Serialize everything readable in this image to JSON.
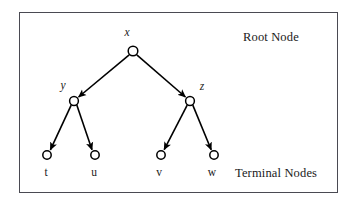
{
  "figure": {
    "type": "diagram",
    "diagram_kind": "binary-tree",
    "background_color": "#ffffff",
    "stroke_color": "#000000",
    "frame_color": "#4a4a52",
    "annotations": {
      "root_label": "Root Node",
      "terminal_label": "Terminal Nodes"
    },
    "nodes": [
      {
        "id": "x",
        "label": "x",
        "role": "root",
        "cx": 133,
        "cy": 51,
        "r": 4.8,
        "label_x": 127,
        "label_y": 26
      },
      {
        "id": "y",
        "label": "y",
        "role": "internal",
        "cx": 74,
        "cy": 101,
        "r": 4.4,
        "label_x": 59,
        "label_y": 80
      },
      {
        "id": "z",
        "label": "z",
        "role": "internal",
        "cx": 190,
        "cy": 101,
        "r": 4.4,
        "label_x": 197,
        "label_y": 81
      },
      {
        "id": "t",
        "label": "t",
        "role": "terminal",
        "cx": 47,
        "cy": 155,
        "r": 4.2,
        "label_x": 41,
        "label_y": 167
      },
      {
        "id": "u",
        "label": "u",
        "role": "terminal",
        "cx": 95,
        "cy": 155,
        "r": 4.2,
        "label_x": 89,
        "label_y": 167
      },
      {
        "id": "v",
        "label": "v",
        "role": "terminal",
        "cx": 161,
        "cy": 155,
        "r": 4.2,
        "label_x": 154,
        "label_y": 167
      },
      {
        "id": "w",
        "label": "w",
        "role": "terminal",
        "cx": 214,
        "cy": 155,
        "r": 4.2,
        "label_x": 207,
        "label_y": 167
      }
    ],
    "edges": [
      {
        "from": "x",
        "to": "y",
        "arrow": true
      },
      {
        "from": "x",
        "to": "z",
        "arrow": true
      },
      {
        "from": "y",
        "to": "t",
        "arrow": true
      },
      {
        "from": "y",
        "to": "u",
        "arrow": true
      },
      {
        "from": "z",
        "to": "v",
        "arrow": true
      },
      {
        "from": "z",
        "to": "w",
        "arrow": true
      }
    ]
  }
}
